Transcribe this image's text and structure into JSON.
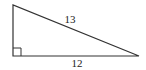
{
  "diagram": {
    "type": "right-triangle",
    "hypotenuse_label": "13",
    "base_label": "12",
    "vertical_leg_label": "",
    "right_angle_marker": true,
    "stroke_color": "#333333"
  }
}
